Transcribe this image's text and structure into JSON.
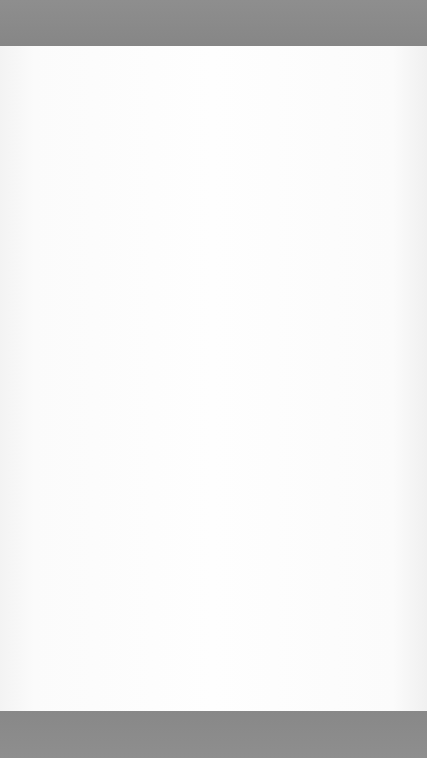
{
  "page": {
    "type": "lined-notepad-paper",
    "background_color": "#8c8c8c",
    "paper_color": "#fdfdfd",
    "rule_color": "#8a8a8a"
  },
  "pattern": {
    "icon": "x-mark-icon",
    "top_band": {
      "height": 47
    },
    "bottom_band": {
      "height": 47
    }
  },
  "paper": {
    "rule_count": 26,
    "first_rule_y": 91,
    "rule_spacing": 23.8
  }
}
